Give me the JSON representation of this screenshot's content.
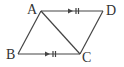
{
  "diagram": {
    "type": "parallelogram",
    "vertices": [
      {
        "label": "A",
        "x": 41,
        "y": 11
      },
      {
        "label": "D",
        "x": 103,
        "y": 11
      },
      {
        "label": "B",
        "x": 18,
        "y": 54
      },
      {
        "label": "C",
        "x": 80,
        "y": 54
      }
    ],
    "segments": [
      "AD",
      "BC",
      "AB",
      "DC",
      "AC"
    ],
    "markings": {
      "AD": "parallel arrow + equal double tick",
      "BC": "parallel arrow + equal double tick"
    },
    "colors": {
      "stroke": "#444444",
      "text": "#333333"
    }
  },
  "labels": {
    "A": "A",
    "B": "B",
    "C": "C",
    "D": "D"
  }
}
